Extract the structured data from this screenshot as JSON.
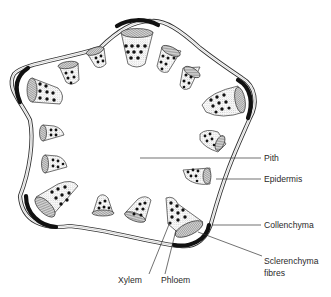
{
  "diagram": {
    "labels": {
      "pith": "Pith",
      "epidermis": "Epidermis",
      "collenchyma": "Collenchyma",
      "sclerenchyma_line1": "Sclerenchyma",
      "sclerenchyma_line2": "fibres",
      "xylem": "Xylem",
      "phloem": "Phloem"
    },
    "structures": {
      "vascular_bundle_count": 15,
      "sclerenchyma_patch_count": 5,
      "outline_shape": "pentagonal, five ridges"
    },
    "colors": {
      "line": "#333333",
      "sclerenchyma": "#111111",
      "text": "#2a2a2a",
      "background": "#ffffff"
    }
  }
}
